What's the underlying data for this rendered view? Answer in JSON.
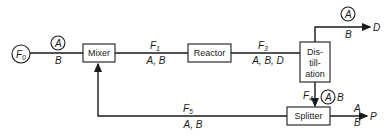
{
  "diagram": {
    "type": "process-flow",
    "feed": {
      "label": "F",
      "subscript": "0",
      "components_circled": "A",
      "components": "B"
    },
    "units": {
      "mixer": "Mixer",
      "reactor": "Reactor",
      "distillation": [
        "Dis-",
        "till-",
        "ation"
      ],
      "splitter": "Splitter"
    },
    "streams": {
      "f1": {
        "label": "F",
        "subscript": "1",
        "components": "A, B"
      },
      "f3": {
        "label": "F",
        "subscript": "3",
        "components": "A, B, D"
      },
      "f4": {
        "label": "F",
        "subscript": "4",
        "components_circled": "A",
        "components": "B"
      },
      "f5": {
        "label": "F",
        "subscript": "5",
        "components": "A, B"
      },
      "top": {
        "components_circled": "A",
        "components": "B",
        "product": "D"
      },
      "out": {
        "component_a": "A",
        "component_b": "B",
        "product": "P"
      }
    }
  }
}
